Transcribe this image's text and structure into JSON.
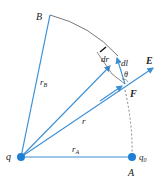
{
  "labels": {
    "B": "B",
    "rB": "r",
    "rB_sub": "B",
    "r": "r",
    "rA": "r",
    "rA_sub": "A",
    "q": "q",
    "q0": "q",
    "q0_sub": "0",
    "A": "A",
    "E": "E",
    "F": "F",
    "dl": "dl",
    "dr": "dr",
    "theta": "θ"
  },
  "colors": {
    "vector": "#3a8fd6",
    "line": "#333333",
    "charge": "#1f7fd6"
  }
}
